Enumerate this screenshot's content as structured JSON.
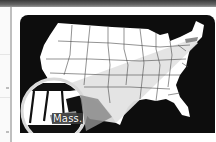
{
  "map": {
    "title": "US map with magnified state",
    "magnified_state_label": "Mass.",
    "colors": {
      "background": "#0d0d0d",
      "land": "#ffffff",
      "beam": "#e3e3e3",
      "highlight_state": "#8c8c8c",
      "borders": "#3a3a3a",
      "magnifier_ring": "#d9d9d9"
    }
  }
}
